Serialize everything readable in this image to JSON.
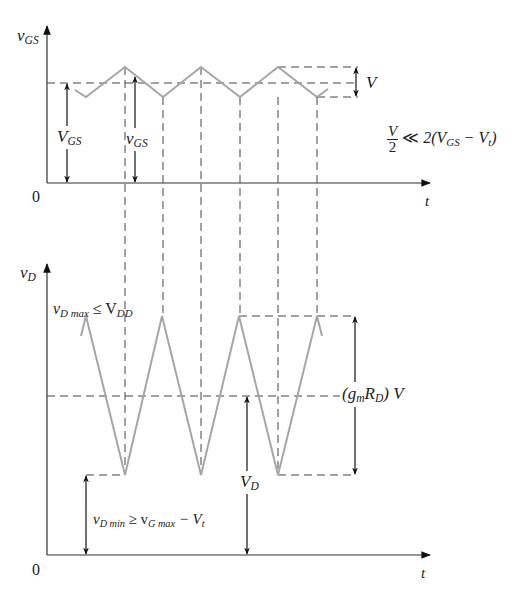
{
  "top_plot": {
    "y_axis_label": "v",
    "y_axis_sub": "GS",
    "x_axis_label": "t",
    "origin_label": "0",
    "dc_label": "V",
    "dc_sub": "GS",
    "total_label": "v",
    "total_sub": "GS",
    "amplitude_label": "V",
    "condition": {
      "num": "V",
      "den": "2",
      "rel": "≪",
      "rhs_pre": "2(V",
      "rhs_sub": "GS",
      "rhs_mid": " − V",
      "rhs_sub2": "t",
      "rhs_post": ")"
    },
    "waveform_color": "#a6a6a6"
  },
  "bottom_plot": {
    "y_axis_label": "v",
    "y_axis_sub": "D",
    "x_axis_label": "t",
    "origin_label": "0",
    "max_label_pre": "v",
    "max_label_sub": "D max",
    "max_label_rel": " ≤ V",
    "max_label_sub2": "DD",
    "amplitude_label_pre": "(g",
    "amplitude_label_sub": "m",
    "amplitude_label_mid": "R",
    "amplitude_label_sub2": "D",
    "amplitude_label_post": ") V",
    "dc_label": "V",
    "dc_sub": "D",
    "min_label_pre": "v",
    "min_label_sub": "D min",
    "min_label_rel": " ≥ v",
    "min_label_sub2": "G max",
    "min_label_mid": " − V",
    "min_label_sub3": "t"
  }
}
